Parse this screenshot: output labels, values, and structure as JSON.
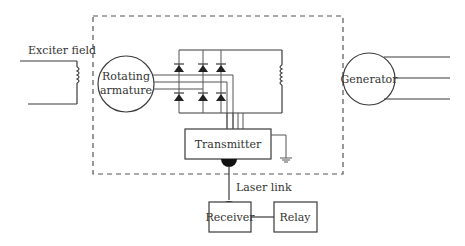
{
  "diagram": {
    "labels": {
      "exciter_field": "Exciter field",
      "rotating_line1": "Rotating",
      "rotating_line2": "armature",
      "generator": "Generator",
      "transmitter": "Transmitter",
      "laser_link": "Laser link",
      "receiver": "Receiver",
      "relay": "Relay"
    },
    "colors": {
      "line": "#3a3a3a",
      "text": "#333333",
      "background": "#ffffff"
    }
  }
}
